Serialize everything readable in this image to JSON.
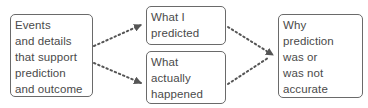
{
  "diagram": {
    "type": "flow",
    "nodes": [
      {
        "id": "events",
        "lines": [
          "Events",
          "and details",
          "that support",
          "prediction",
          "and outcome"
        ]
      },
      {
        "id": "predicted",
        "lines": [
          "What I",
          "predicted"
        ]
      },
      {
        "id": "happened",
        "lines": [
          "What",
          "actually",
          "happened"
        ]
      },
      {
        "id": "why",
        "lines": [
          "Why",
          "prediction",
          "was or",
          "was not",
          "accurate"
        ]
      }
    ],
    "edges": [
      {
        "from": "events",
        "to": "predicted",
        "style": "dotted"
      },
      {
        "from": "events",
        "to": "happened",
        "style": "dotted"
      },
      {
        "from": "predicted",
        "to": "why",
        "style": "dotted"
      },
      {
        "from": "happened",
        "to": "why",
        "style": "dotted"
      }
    ],
    "colors": {
      "border": "#6a6a6a",
      "text": "#4a4a4a",
      "arrow": "#555555"
    }
  }
}
